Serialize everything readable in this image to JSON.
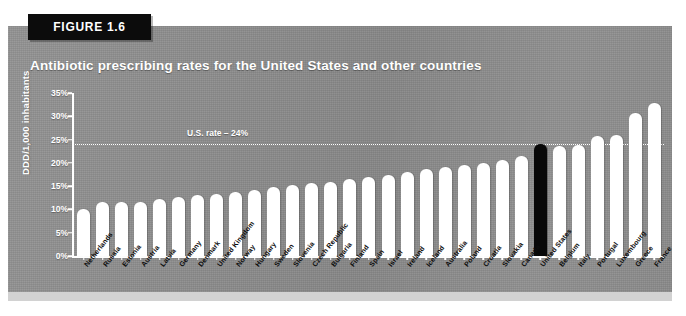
{
  "figure": {
    "badge_label": "FIGURE 1.6",
    "title": "Antibiotic prescribing rates for the United States and other countries"
  },
  "colors": {
    "panel_background": "#8d8d8d",
    "bar_default": "#ffffff",
    "bar_highlight": "#080808",
    "axis": "#ffffff",
    "badge_background": "#0c0c0c",
    "title_text": "#ffffff",
    "xlabel_text": "#0d0d0d",
    "bottom_band": "#d2d2d2"
  },
  "chart_data": {
    "type": "bar",
    "title": "Antibiotic prescribing rates for the United States and other countries",
    "xlabel": "",
    "ylabel": "DDD/1,000 inhabitants",
    "ylim": [
      0,
      35
    ],
    "ytick_labels": [
      "0%",
      "5%",
      "10%",
      "15%",
      "20%",
      "25%",
      "30%",
      "35%"
    ],
    "ytick_values": [
      0,
      5,
      10,
      15,
      20,
      25,
      30,
      35
    ],
    "grid": false,
    "legend": "none",
    "highlight_category": "United States",
    "annotations": [
      {
        "name": "us-rate-reference",
        "text": "U.S. rate – 24%",
        "value": 24,
        "style": "dotted-horizontal-line"
      }
    ],
    "categories": [
      "Netherlands",
      "Russia",
      "Estonia",
      "Austria",
      "Latvia",
      "Germany",
      "Denmark",
      "United Kingdom",
      "Norway",
      "Hungary",
      "Sweden",
      "Slovenia",
      "Czech Republic",
      "Bulgaria",
      "Finland",
      "Spain",
      "Israel",
      "Ireland",
      "Iceland",
      "Australia",
      "Poland",
      "Croatia",
      "Slovakia",
      "Canada",
      "United States",
      "Belgium",
      "Italy",
      "Portugal",
      "Luxembourg",
      "Greece",
      "France"
    ],
    "values": [
      10.0,
      11.5,
      11.6,
      11.7,
      12.2,
      12.6,
      13.0,
      13.3,
      13.8,
      14.2,
      14.8,
      15.3,
      15.6,
      16.0,
      16.5,
      17.0,
      17.5,
      18.1,
      18.6,
      19.2,
      19.6,
      20.0,
      20.6,
      21.4,
      24.0,
      23.6,
      23.8,
      25.8,
      25.9,
      30.8,
      32.8
    ]
  }
}
